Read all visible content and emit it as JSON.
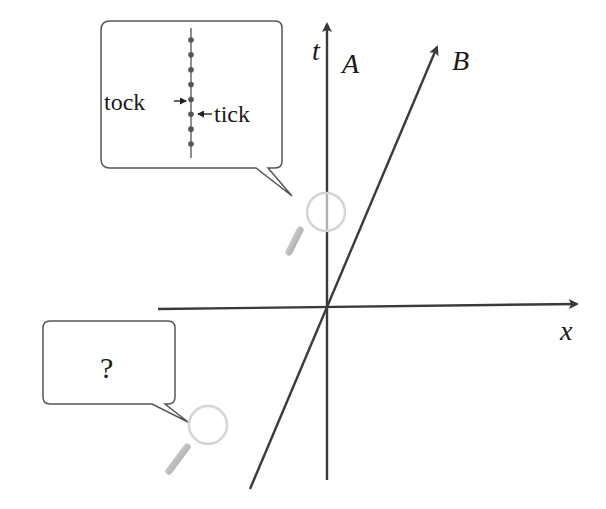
{
  "axes": {
    "time_label": "t",
    "space_label": "x"
  },
  "worldlines": [
    {
      "label": "A",
      "description": "vertical worldline (at rest)"
    },
    {
      "label": "B",
      "description": "tilted worldline (moving)"
    }
  ],
  "callout_top": {
    "tock_label": "tock",
    "tick_label": "tick",
    "dot_count": 8
  },
  "callout_bottom": {
    "text": "?"
  },
  "colors": {
    "line": "#3a3a3a",
    "bubble_border": "#555555",
    "magnifier_rim": "#d6d6d6",
    "magnifier_handle": "#b0b0b0"
  }
}
